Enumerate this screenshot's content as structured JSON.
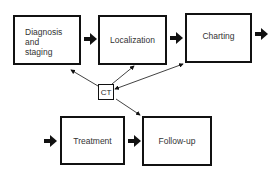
{
  "diagram": {
    "nodes": [
      {
        "id": "diagnosis",
        "label_lines": [
          "Diagnosis",
          "and",
          "staging"
        ]
      },
      {
        "id": "localization",
        "label": "Localization"
      },
      {
        "id": "charting",
        "label": "Charting"
      },
      {
        "id": "ct",
        "label": "CT"
      },
      {
        "id": "treatment",
        "label": "Treatment"
      },
      {
        "id": "followup",
        "label": "Follow-up"
      }
    ],
    "flow_edges": [
      {
        "from": "diagnosis",
        "to": "localization",
        "style": "thick-arrow"
      },
      {
        "from": "localization",
        "to": "charting",
        "style": "thick-arrow"
      },
      {
        "from": "charting",
        "to": "offscreen-right",
        "style": "thick-arrow"
      },
      {
        "from": "offscreen-left",
        "to": "treatment",
        "style": "thick-arrow"
      },
      {
        "from": "treatment",
        "to": "followup",
        "style": "thick-arrow"
      }
    ],
    "ct_edges": [
      {
        "from": "ct",
        "to": "diagnosis",
        "style": "thin-arrow"
      },
      {
        "from": "ct",
        "to": "localization",
        "style": "thin-arrow"
      },
      {
        "from": "ct",
        "to": "charting",
        "style": "thin-double-arrow"
      },
      {
        "from": "ct",
        "to": "followup",
        "style": "thin-arrow"
      }
    ]
  },
  "colors": {
    "stroke": "#111111",
    "text": "#333333",
    "background": "#ffffff"
  }
}
